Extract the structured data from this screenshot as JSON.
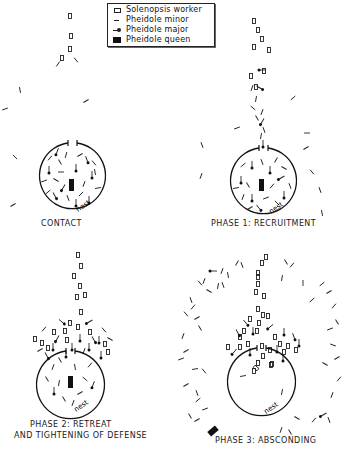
{
  "legend": {
    "items": [
      {
        "symbol": "open-rectangle",
        "label": "Solenopsis worker"
      },
      {
        "symbol": "short-dash",
        "label": "Pheidole minor"
      },
      {
        "symbol": "dash-with-dot",
        "label": "Pheidole major"
      },
      {
        "symbol": "filled-rectangle",
        "label": "Pheidole queen"
      }
    ]
  },
  "panels": [
    {
      "id": "contact",
      "caption": "CONTACT",
      "nest_label": "nest"
    },
    {
      "id": "phase1",
      "caption": "PHASE  1:  RECRUITMENT",
      "nest_label": "nest"
    },
    {
      "id": "phase2",
      "caption_line1": "PHASE 2:  RETREAT",
      "caption_line2": "AND TIGHTENING OF DEFENSE",
      "nest_label": "nest"
    },
    {
      "id": "phase3",
      "caption": "PHASE 3:  ABSCONDING",
      "nest_label": "nest"
    }
  ],
  "colors": {
    "ink": "#1a1a1a",
    "background": "#ffffff"
  }
}
